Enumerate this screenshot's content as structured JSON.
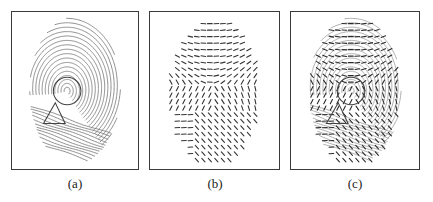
{
  "figure": {
    "panels": [
      {
        "id": "a",
        "label": "(a)",
        "content": "fingerprint image with core (circle) and delta (triangle) singular points marked"
      },
      {
        "id": "b",
        "label": "(b)",
        "content": "estimated ridge orientation field"
      },
      {
        "id": "c",
        "label": "(c)",
        "content": "orientation field overlaid on fingerprint image"
      }
    ],
    "markers": {
      "core": {
        "shape": "circle"
      },
      "delta": {
        "shape": "triangle"
      }
    },
    "colors": {
      "ridge": "#6a6a6a",
      "orientation": "#333333",
      "border": "#3a3a3a"
    }
  }
}
